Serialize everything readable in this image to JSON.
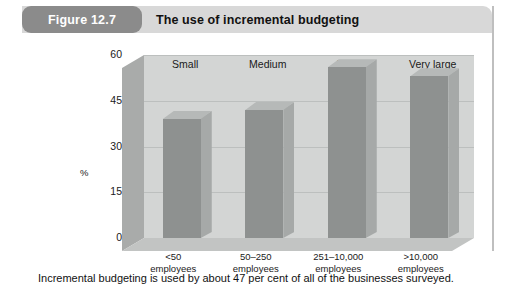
{
  "figure": {
    "badge": "Figure 12.7",
    "title": "The use of incremental budgeting",
    "caption": "Incremental budgeting is used by about 47 per cent of all of the businesses surveyed."
  },
  "colors": {
    "badge_bg": "#8b8b8b",
    "header_bg": "#d8d8d8",
    "bar_front": "#8e9190",
    "bar_side": "#a6a9a8",
    "bar_top": "#b6b9b8",
    "back_wall": "#d3d5d4",
    "floor": "#c2c4c3",
    "left_wall": "#a9abaa",
    "gridline": "#bcbfbe"
  },
  "chart_data": {
    "type": "bar",
    "title": "The use of incremental budgeting",
    "xlabel": "",
    "ylabel": "%",
    "ylim": [
      0,
      60
    ],
    "yticks": [
      0,
      15,
      30,
      45,
      60
    ],
    "grid": true,
    "legend": "none",
    "style": "3d-column",
    "categories": [
      "<50 employees",
      "50–250 employees",
      "251–10,000 employees",
      ">10,000 employees"
    ],
    "category_top_labels": [
      "Small",
      "Medium",
      "Large",
      "Very large"
    ],
    "category_lines": [
      [
        "<50",
        "employees"
      ],
      [
        "50–250",
        "employees"
      ],
      [
        "251–10,000",
        "employees"
      ],
      [
        ">10,000",
        "employees"
      ]
    ],
    "values": [
      39,
      42,
      56,
      53
    ],
    "annotations": [
      "Incremental budgeting is used by about 47 per cent of all of the businesses surveyed."
    ]
  }
}
